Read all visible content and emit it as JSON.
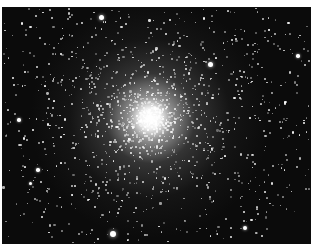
{
  "image": {
    "subject": "globular star cluster",
    "description": "Black-and-white telescope photograph of a dense globular star cluster with a bright white core and scattered field stars",
    "colors": {
      "background": "#0b0b0b",
      "stars": "#ffffff",
      "margin": "#ffffff"
    },
    "bright_stars": [
      {
        "x": 101,
        "y": 17,
        "r": 2.5
      },
      {
        "x": 210,
        "y": 64,
        "r": 2.5
      },
      {
        "x": 298,
        "y": 56,
        "r": 1.8
      },
      {
        "x": 19,
        "y": 120,
        "r": 1.8
      },
      {
        "x": 38,
        "y": 170,
        "r": 1.8
      },
      {
        "x": 30,
        "y": 183,
        "r": 1.5
      },
      {
        "x": 113,
        "y": 234,
        "r": 3
      },
      {
        "x": 245,
        "y": 228,
        "r": 2
      },
      {
        "x": 72,
        "y": 195,
        "r": 1.4
      },
      {
        "x": 250,
        "y": 118,
        "r": 1.3
      }
    ]
  }
}
